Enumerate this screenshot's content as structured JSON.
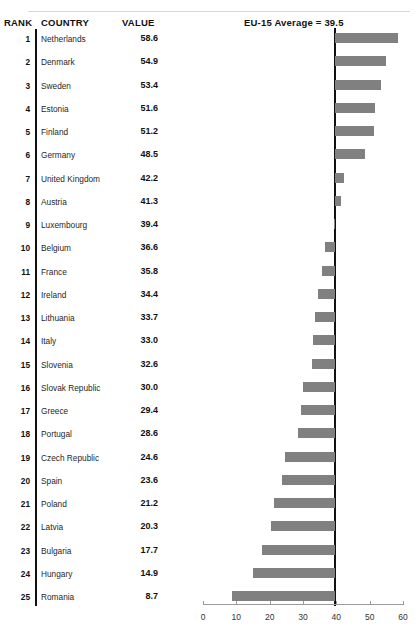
{
  "header": {
    "rank_label": "RANK",
    "country_label": "COUNTRY",
    "value_label": "VALUE",
    "average_label": "EU-15 Average = 39.5"
  },
  "style": {
    "bar_color": "#808080",
    "reference_line_color": "#111111",
    "axis_color": "#9a9a9a",
    "rule_color": "#d8d8d8"
  },
  "chart_data": {
    "type": "bar",
    "orientation": "horizontal",
    "title": "EU-15 Average = 39.5",
    "xlabel": "",
    "ylabel": "",
    "xlim": [
      0,
      60
    ],
    "xticks": [
      0,
      10,
      20,
      30,
      40,
      50,
      60
    ],
    "xtick_labels": [
      "0",
      "10",
      "20",
      "30",
      "40",
      "50",
      "60"
    ],
    "grid": false,
    "legend": null,
    "reference_line": {
      "value": 39.5,
      "label": "EU-15 Average = 39.5"
    },
    "categories": [
      "Netherlands",
      "Denmark",
      "Sweden",
      "Estonia",
      "Finland",
      "Germany",
      "United Kingdom",
      "Austria",
      "Luxembourg",
      "Belgium",
      "France",
      "Ireland",
      "Lithuania",
      "Italy",
      "Slovenia",
      "Slovak Republic",
      "Greece",
      "Portugal",
      "Czech Republic",
      "Spain",
      "Poland",
      "Latvia",
      "Bulgaria",
      "Hungary",
      "Romania"
    ],
    "values": [
      58.6,
      54.9,
      53.4,
      51.6,
      51.2,
      48.5,
      42.2,
      41.3,
      39.4,
      36.6,
      35.8,
      34.4,
      33.7,
      33.0,
      32.6,
      30.0,
      29.4,
      28.6,
      24.6,
      23.6,
      21.2,
      20.3,
      17.7,
      14.9,
      8.7
    ],
    "ranks": [
      "1",
      "2",
      "3",
      "4",
      "5",
      "6",
      "7",
      "8",
      "9",
      "10",
      "11",
      "12",
      "13",
      "14",
      "15",
      "16",
      "17",
      "18",
      "19",
      "20",
      "21",
      "22",
      "23",
      "24",
      "25"
    ],
    "value_labels": [
      "58.6",
      "54.9",
      "53.4",
      "51.6",
      "51.2",
      "48.5",
      "42.2",
      "41.3",
      "39.4",
      "36.6",
      "35.8",
      "34.4",
      "33.7",
      "33.0",
      "32.6",
      "30.0",
      "29.4",
      "28.6",
      "24.6",
      "23.6",
      "21.2",
      "20.3",
      "17.7",
      "14.9",
      "8.7"
    ]
  }
}
